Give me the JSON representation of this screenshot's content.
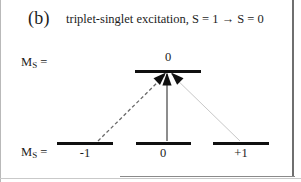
{
  "figure": {
    "panel_label": "(b)",
    "title": "triplet-singlet excitation, S = 1 → S = 0",
    "ms_label_upper": "M",
    "ms_label_upper_sub": "S",
    "ms_label_upper_eq": " =",
    "ms_label_lower": "M",
    "ms_label_lower_sub": "S",
    "ms_label_lower_eq": " =",
    "colors": {
      "level_line": "#101010",
      "arrow_black": "#101010",
      "transition_vertical": "#8d8d8d",
      "transition_right": "#c8c8c8",
      "transition_dashed": "#6a6a6a",
      "background": "#ffffff",
      "border": "#6f6f6f"
    }
  },
  "chart_data": {
    "type": "diagram",
    "title": "triplet-singlet excitation, S = 1 → S = 0",
    "panel": "(b)",
    "axis_label": "M_S",
    "upper_state": {
      "spin_multiplicity": "singlet",
      "total_spin_S": 0,
      "levels": [
        {
          "ms": "0",
          "label": "0",
          "x_center": 168,
          "y": 70
        }
      ]
    },
    "lower_state": {
      "spin_multiplicity": "triplet",
      "total_spin_S": 1,
      "levels": [
        {
          "ms": "-1",
          "label": "-1",
          "x_center": 85,
          "y": 142
        },
        {
          "ms": "0",
          "label": "0",
          "x_center": 163,
          "y": 142
        },
        {
          "ms": "+1",
          "label": "+1",
          "x_center": 241,
          "y": 142
        }
      ]
    },
    "transitions": [
      {
        "from_ms": "-1",
        "to_ms": "0",
        "style": "dashed",
        "color": "#6a6a6a",
        "arrowhead": true,
        "x1": 98,
        "y1": 141,
        "x2": 166,
        "y2": 74
      },
      {
        "from_ms": "0",
        "to_ms": "0",
        "style": "solid",
        "color": "#8d8d8d",
        "arrowhead": true,
        "x1": 167,
        "y1": 141,
        "x2": 167,
        "y2": 74
      },
      {
        "from_ms": "+1",
        "to_ms": "0",
        "style": "solid-light",
        "color": "#c8c8c8",
        "arrowhead": true,
        "x1": 240,
        "y1": 141,
        "x2": 171,
        "y2": 74
      }
    ],
    "legend": [],
    "grid": false
  }
}
